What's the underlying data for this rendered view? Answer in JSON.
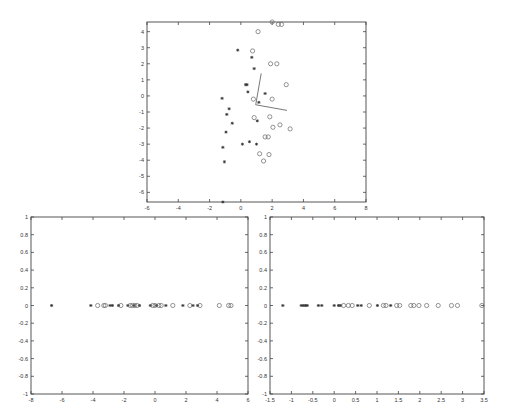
{
  "chart_data": [
    {
      "type": "scatter",
      "title": "",
      "xlabel": "",
      "ylabel": "",
      "xlim": [
        -6,
        8
      ],
      "ylim": [
        -6.6,
        4.6
      ],
      "xticks": [
        -6,
        -4,
        -2,
        0,
        2,
        4,
        6,
        8
      ],
      "yticks": [
        -6,
        -5,
        -4,
        -3,
        -2,
        -1,
        0,
        1,
        2,
        3,
        4
      ],
      "grid": false,
      "box": {
        "left": 147,
        "top": 22,
        "right": 366,
        "bottom": 202
      },
      "series": [
        {
          "name": "class-star",
          "marker": "*",
          "points": [
            [
              -0.2,
              2.85
            ],
            [
              0.7,
              2.4
            ],
            [
              0.85,
              1.7
            ],
            [
              0.3,
              0.7
            ],
            [
              0.4,
              0.7
            ],
            [
              0.45,
              0.25
            ],
            [
              1.55,
              0.15
            ],
            [
              -1.2,
              -0.15
            ],
            [
              1.15,
              -0.4
            ],
            [
              -0.75,
              -0.8
            ],
            [
              -0.9,
              -1.15
            ],
            [
              -0.55,
              -1.7
            ],
            [
              1.05,
              -1.55
            ],
            [
              -0.95,
              -2.25
            ],
            [
              0.55,
              -2.85
            ],
            [
              0.1,
              -3.0
            ],
            [
              1.0,
              -3.0
            ],
            [
              -1.15,
              -3.2
            ],
            [
              -1.05,
              -4.1
            ],
            [
              -1.15,
              -6.6
            ]
          ]
        },
        {
          "name": "class-circle",
          "marker": "o",
          "points": [
            [
              2.0,
              4.6
            ],
            [
              2.4,
              4.45
            ],
            [
              2.6,
              4.45
            ],
            [
              1.1,
              4.0
            ],
            [
              0.75,
              2.8
            ],
            [
              1.9,
              2.0
            ],
            [
              2.3,
              2.0
            ],
            [
              2.9,
              0.7
            ],
            [
              0.8,
              -0.2
            ],
            [
              2.0,
              -0.2
            ],
            [
              0.85,
              -1.35
            ],
            [
              1.85,
              -1.3
            ],
            [
              2.05,
              -1.95
            ],
            [
              2.5,
              -1.8
            ],
            [
              3.15,
              -2.05
            ],
            [
              1.55,
              -2.55
            ],
            [
              1.75,
              -2.55
            ],
            [
              1.2,
              -3.6
            ],
            [
              1.8,
              -3.65
            ],
            [
              1.45,
              -4.05
            ]
          ]
        }
      ],
      "lines": [
        {
          "from": [
            0.95,
            -0.55
          ],
          "to": [
            1.3,
            1.4
          ]
        },
        {
          "from": [
            0.95,
            -0.55
          ],
          "to": [
            2.95,
            -0.9
          ]
        }
      ]
    },
    {
      "type": "scatter",
      "title": "",
      "xlabel": "",
      "ylabel": "",
      "xlim": [
        -8,
        6
      ],
      "ylim": [
        -1,
        1
      ],
      "xticks": [
        -8,
        -6,
        -4,
        -2,
        0,
        2,
        4,
        6
      ],
      "yticks": [
        -1,
        -0.8,
        -0.6,
        -0.4,
        -0.2,
        0,
        0.2,
        0.4,
        0.6,
        0.8,
        1
      ],
      "grid": false,
      "box": {
        "left": 31,
        "top": 217,
        "right": 248,
        "bottom": 394
      },
      "series": [
        {
          "name": "class-star",
          "marker": "*",
          "x": [
            -6.67,
            -4.14,
            -2.9,
            -2.75,
            -2.35,
            -1.75,
            -1.35,
            -1.0,
            -0.3,
            0.1,
            0.7,
            1.8,
            2.45,
            2.75
          ]
        },
        {
          "name": "class-circle",
          "marker": "o",
          "x": [
            -3.7,
            -3.3,
            -3.2,
            -2.2,
            -1.6,
            -1.45,
            -1.3,
            -1.15,
            -0.15,
            0.0,
            0.25,
            0.4,
            1.15,
            2.25,
            2.9,
            4.15,
            4.75,
            4.9
          ]
        }
      ],
      "y": 0
    },
    {
      "type": "scatter",
      "title": "",
      "xlabel": "",
      "ylabel": "",
      "xlim": [
        -1.5,
        3.5
      ],
      "ylim": [
        -1,
        1
      ],
      "xticks": [
        -1.5,
        -1,
        -0.5,
        0,
        0.5,
        1,
        1.5,
        2,
        2.5,
        3,
        3.5
      ],
      "yticks": [
        -1,
        -0.8,
        -0.6,
        -0.4,
        -0.2,
        0,
        0.2,
        0.4,
        0.6,
        0.8,
        1
      ],
      "grid": false,
      "box": {
        "left": 270,
        "top": 217,
        "right": 484,
        "bottom": 394
      },
      "series": [
        {
          "name": "class-star",
          "marker": "*",
          "x": [
            -1.2,
            -0.77,
            -0.72,
            -0.67,
            -0.63,
            -0.37,
            -0.29,
            0.0,
            0.1,
            0.15,
            0.55,
            0.63,
            1.01,
            1.32
          ]
        },
        {
          "name": "class-circle",
          "marker": "o",
          "x": [
            0.22,
            0.33,
            0.42,
            0.82,
            1.15,
            1.21,
            1.46,
            1.53,
            1.79,
            1.86,
            1.98,
            2.16,
            2.43,
            2.74,
            2.88,
            3.45
          ]
        }
      ],
      "y": 0
    }
  ]
}
